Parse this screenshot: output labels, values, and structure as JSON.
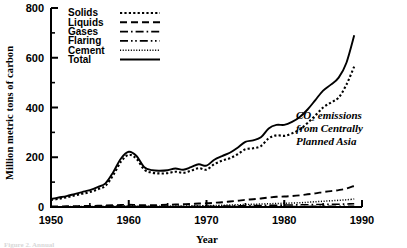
{
  "chart_data": {
    "type": "line",
    "title": "",
    "xlabel": "Year",
    "ylabel": "Million metric tons of carbon",
    "annotation": [
      "CO₂ emissions",
      "from Centrally",
      "Planned Asia"
    ],
    "xlim": [
      1950,
      1990
    ],
    "ylim": [
      0,
      800
    ],
    "xticks": [
      1950,
      1960,
      1970,
      1980,
      1990
    ],
    "yticks": [
      0,
      200,
      400,
      600,
      800
    ],
    "xminor_step": 2,
    "yminor_step": 100,
    "grid": false,
    "legend_position": "top-left",
    "x": [
      1950,
      1951,
      1952,
      1953,
      1954,
      1955,
      1956,
      1957,
      1958,
      1959,
      1960,
      1961,
      1962,
      1963,
      1964,
      1965,
      1966,
      1967,
      1968,
      1969,
      1970,
      1971,
      1972,
      1973,
      1974,
      1975,
      1976,
      1977,
      1978,
      1979,
      1980,
      1981,
      1982,
      1983,
      1984,
      1985,
      1986,
      1987,
      1988,
      1989
    ],
    "series": [
      {
        "name": "Total",
        "style": "solid",
        "values": [
          32,
          38,
          44,
          52,
          60,
          68,
          80,
          95,
          140,
          195,
          222,
          205,
          160,
          148,
          146,
          148,
          155,
          150,
          160,
          172,
          166,
          190,
          205,
          218,
          238,
          262,
          268,
          280,
          316,
          330,
          330,
          342,
          362,
          392,
          430,
          468,
          492,
          520,
          580,
          690
        ]
      },
      {
        "name": "Solids",
        "style": "dotted",
        "values": [
          28,
          33,
          39,
          46,
          53,
          60,
          71,
          85,
          128,
          182,
          210,
          194,
          150,
          138,
          135,
          136,
          142,
          137,
          146,
          156,
          150,
          172,
          186,
          196,
          212,
          232,
          236,
          245,
          276,
          288,
          286,
          296,
          312,
          338,
          368,
          400,
          420,
          440,
          492,
          565
        ]
      },
      {
        "name": "Liquids",
        "style": "dashed",
        "values": [
          2,
          2,
          3,
          3,
          4,
          4,
          5,
          6,
          7,
          8,
          9,
          8,
          7,
          7,
          8,
          9,
          10,
          11,
          12,
          14,
          15,
          17,
          19,
          22,
          25,
          29,
          31,
          34,
          38,
          41,
          42,
          44,
          47,
          51,
          55,
          60,
          64,
          68,
          74,
          85
        ]
      },
      {
        "name": "Gases",
        "style": "dashdot",
        "values": [
          0,
          0,
          0,
          0,
          0,
          0,
          1,
          1,
          1,
          1,
          2,
          2,
          2,
          2,
          2,
          2,
          2,
          2,
          2,
          3,
          3,
          3,
          4,
          4,
          5,
          5,
          6,
          6,
          7,
          7,
          8,
          8,
          9,
          9,
          10,
          10,
          11,
          11,
          12,
          13
        ]
      },
      {
        "name": "Flaring",
        "style": "dashdotdot",
        "values": [
          0,
          0,
          0,
          0,
          0,
          0,
          0,
          0,
          0,
          0,
          1,
          1,
          1,
          1,
          1,
          1,
          1,
          1,
          1,
          1,
          1,
          1,
          1,
          2,
          2,
          2,
          2,
          2,
          2,
          2,
          2,
          2,
          2,
          2,
          3,
          3,
          3,
          3,
          3,
          3
        ]
      },
      {
        "name": "Cement",
        "style": "finedot",
        "values": [
          1,
          1,
          1,
          2,
          2,
          2,
          3,
          3,
          4,
          4,
          5,
          4,
          3,
          3,
          3,
          4,
          4,
          4,
          5,
          5,
          5,
          6,
          7,
          8,
          9,
          10,
          11,
          12,
          13,
          14,
          15,
          16,
          17,
          19,
          21,
          23,
          25,
          27,
          29,
          32
        ]
      }
    ]
  },
  "legend": {
    "entries": [
      {
        "label": "Solids",
        "style": "dotted"
      },
      {
        "label": "Liquids",
        "style": "dashed"
      },
      {
        "label": "Gases",
        "style": "dashdot"
      },
      {
        "label": "Flaring",
        "style": "dashdotdot"
      },
      {
        "label": "Cement",
        "style": "finedot"
      },
      {
        "label": "Total",
        "style": "solid"
      }
    ]
  },
  "axis": {
    "y_title": "Million metric tons of carbon",
    "x_title": "Year",
    "y_tick_labels": [
      "800",
      "600",
      "400",
      "200",
      "0"
    ],
    "x_tick_labels": [
      "1950",
      "1960",
      "1970",
      "1980",
      "1990"
    ]
  },
  "annotation": {
    "line1": "CO₂ emissions",
    "line2": "from Centrally",
    "line3": "Planned Asia"
  },
  "caption": {
    "text": "Figure 2. Annual"
  },
  "colors": {
    "ink": "#000000",
    "background": "#ffffff"
  }
}
